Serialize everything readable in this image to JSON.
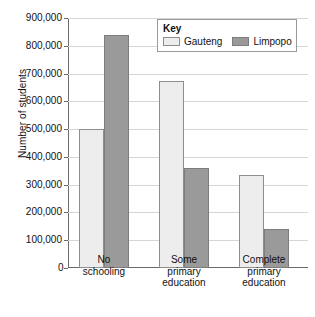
{
  "chart_data": {
    "type": "bar",
    "title": "",
    "xlabel": "",
    "ylabel": "Number of students",
    "ylim": [
      0,
      900000
    ],
    "ytick_step": 100000,
    "ytick_labels": [
      "0",
      "100,000",
      "200,000",
      "300,000",
      "400,000",
      "500,000",
      "600,000",
      "700,000",
      "800,000",
      "900,000"
    ],
    "grid": true,
    "legend": {
      "title": "Key",
      "position": "top-right"
    },
    "categories": [
      "No\nschooling",
      "Some\nprimary\neducation",
      "Complete\nprimary\neducation"
    ],
    "series": [
      {
        "name": "Gauteng",
        "color": "#ededed",
        "values": [
          500000,
          675000,
          335000
        ]
      },
      {
        "name": "Limpopo",
        "color": "#9a9a9a",
        "values": [
          840000,
          360000,
          140000
        ]
      }
    ]
  }
}
